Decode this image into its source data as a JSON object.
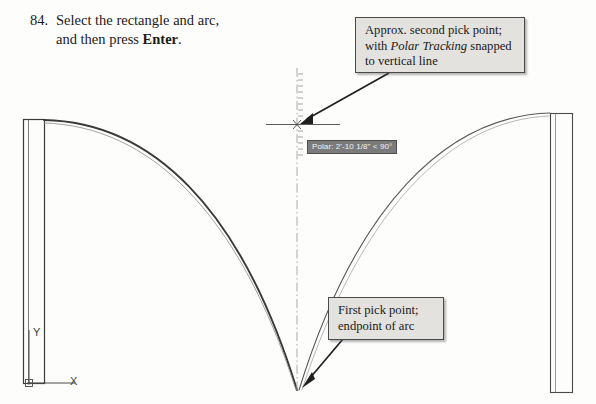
{
  "page": {
    "width": 596,
    "height": 404,
    "background_color": "#fdfdfc"
  },
  "step": {
    "number": "84.",
    "line1": "Select the rectangle and arc,",
    "line2_prefix": "and then press ",
    "line2_bold": "Enter",
    "line2_suffix": "."
  },
  "callouts": {
    "polar": {
      "line1": "Approx. second pick point;",
      "line2_prefix": "with ",
      "line2_italic": "Polar Tracking",
      "line2_suffix": " snapped",
      "line3": "to vertical line",
      "background_color": "#e3e2de",
      "border_color": "#4a4a4a"
    },
    "first_pick": {
      "line1": "First pick point;",
      "line2": "endpoint of arc",
      "background_color": "#e3e2de",
      "border_color": "#4a4a4a"
    }
  },
  "tooltip": {
    "text": "Polar: 2'-10 1/8\" < 90°",
    "background_color": "#7b7b7b",
    "text_color": "#f2f2f2"
  },
  "ucs_icon": {
    "x_label": "X",
    "y_label": "Y"
  },
  "drawing": {
    "stroke_color": "#3a3a3a",
    "light_stroke_color": "#6f6f6f",
    "tracking_line_color": "#9a9a9a",
    "left_rectangle": {
      "x": 23,
      "y": 119,
      "width": 21,
      "height": 264
    },
    "right_rectangle": {
      "x": 550,
      "y": 113,
      "width": 22,
      "height": 279
    },
    "left_arc": {
      "start_x": 44,
      "start_y": 120,
      "end_x": 297,
      "end_y": 390
    },
    "right_arc": {
      "start_x": 299,
      "start_y": 390,
      "end_x": 550,
      "end_y": 113
    },
    "crosshair": {
      "x": 297,
      "y": 124
    },
    "tracking_line": {
      "x": 297,
      "top_y": 68,
      "bottom_y": 390
    }
  },
  "arrows": {
    "polar_arrow": {
      "from_x": 389,
      "from_y": 73,
      "to_x": 300,
      "to_y": 123
    },
    "first_pick_arrow": {
      "from_x": 343,
      "from_y": 339,
      "to_x": 303,
      "to_y": 386
    }
  }
}
